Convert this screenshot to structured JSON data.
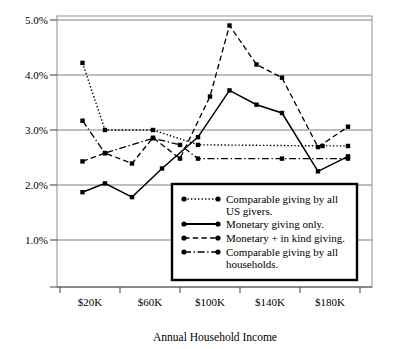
{
  "chart_data": {
    "type": "line",
    "title": "",
    "xlabel": "Annual Household Income",
    "ylabel": "",
    "grid": true,
    "legend_position": "inside-bottom-right",
    "ylim": [
      0.5,
      5.0
    ],
    "ytick_labels": [
      "5.0%",
      "4.0%",
      "3.0%",
      "2.0%",
      "1.0%"
    ],
    "ytick_values": [
      5.0,
      4.0,
      3.0,
      2.0,
      1.0
    ],
    "xtick_labels": [
      "$20K",
      "$60K",
      "$100K",
      "$140K",
      "$180K"
    ],
    "xtick_values": [
      20,
      60,
      100,
      140,
      180
    ],
    "xlim": [
      5,
      200
    ],
    "series": [
      {
        "name": "Comparable giving by all US givers.",
        "style": "dotted",
        "x": [
          15,
          30,
          62,
          92,
          175,
          192
        ],
        "values": [
          4.22,
          3.0,
          3.0,
          2.73,
          2.71,
          2.71
        ]
      },
      {
        "name": "Monetary giving only.",
        "style": "solid",
        "x": [
          15,
          30,
          48,
          68,
          92,
          113,
          131,
          148,
          172,
          192
        ],
        "values": [
          1.87,
          2.03,
          1.78,
          2.3,
          2.87,
          3.72,
          3.46,
          3.31,
          2.25,
          2.52
        ]
      },
      {
        "name": "Monetary + in kind giving.",
        "style": "dashed",
        "x": [
          15,
          30,
          48,
          62,
          80,
          100,
          113,
          131,
          148,
          172,
          192
        ],
        "values": [
          2.43,
          2.58,
          2.39,
          2.86,
          2.48,
          3.61,
          4.9,
          4.19,
          3.95,
          2.69,
          3.06
        ]
      },
      {
        "name": "Comparable giving by all households.",
        "style": "dashdot",
        "x": [
          15,
          30,
          62,
          80,
          92,
          148,
          192
        ],
        "values": [
          3.17,
          2.58,
          2.85,
          2.73,
          2.48,
          2.48,
          2.48
        ]
      }
    ]
  },
  "legend": {
    "entries": [
      {
        "label_line1": "Comparable giving by all",
        "label_line2": "US givers.",
        "style": "dotted"
      },
      {
        "label_line1": "Monetary giving only.",
        "label_line2": "",
        "style": "solid"
      },
      {
        "label_line1": "Monetary + in kind giving.",
        "label_line2": "",
        "style": "dashed"
      },
      {
        "label_line1": "Comparable giving by all",
        "label_line2": "households.",
        "style": "dashdot"
      }
    ]
  },
  "colors": {
    "line": "#000000",
    "grid": "#808080",
    "frame": "#999999",
    "background": "#ffffff"
  }
}
